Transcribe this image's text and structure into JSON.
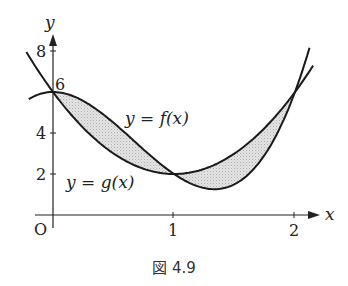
{
  "chart_data": {
    "type": "line",
    "title": "",
    "caption": "図 4.9",
    "xlabel": "x",
    "ylabel": "y",
    "origin_label": "O",
    "x_ticks": [
      "1",
      "2"
    ],
    "y_ticks": [
      "2",
      "4",
      "8"
    ],
    "point_label_6": "6",
    "xlim": [
      0,
      2.1
    ],
    "ylim": [
      0,
      8.5
    ],
    "series": [
      {
        "name": "y = f(x)",
        "expression": "4x^3 - 8x^2 + 6",
        "x": [
          0,
          0.25,
          0.5,
          0.75,
          1,
          1.25,
          1.333,
          1.5,
          1.75,
          2
        ],
        "values": [
          6,
          5.56,
          4.5,
          3.19,
          2,
          1.31,
          1.26,
          1.5,
          2.94,
          6
        ]
      },
      {
        "name": "y = g(x)",
        "expression": "4x^2 - 8x + 6",
        "x": [
          0,
          0.25,
          0.5,
          0.75,
          1,
          1.25,
          1.5,
          1.75,
          2
        ],
        "values": [
          6,
          4.25,
          3,
          2.25,
          2,
          2.25,
          3,
          4.25,
          6
        ]
      }
    ],
    "intersections": [
      [
        0,
        6
      ],
      [
        1,
        2
      ],
      [
        2,
        6
      ]
    ],
    "shaded_regions": [
      "between f and g on [0,1]",
      "between g and f on [1,2]"
    ],
    "labels": {
      "f": "y = f(x)",
      "g": "y = g(x)"
    }
  }
}
